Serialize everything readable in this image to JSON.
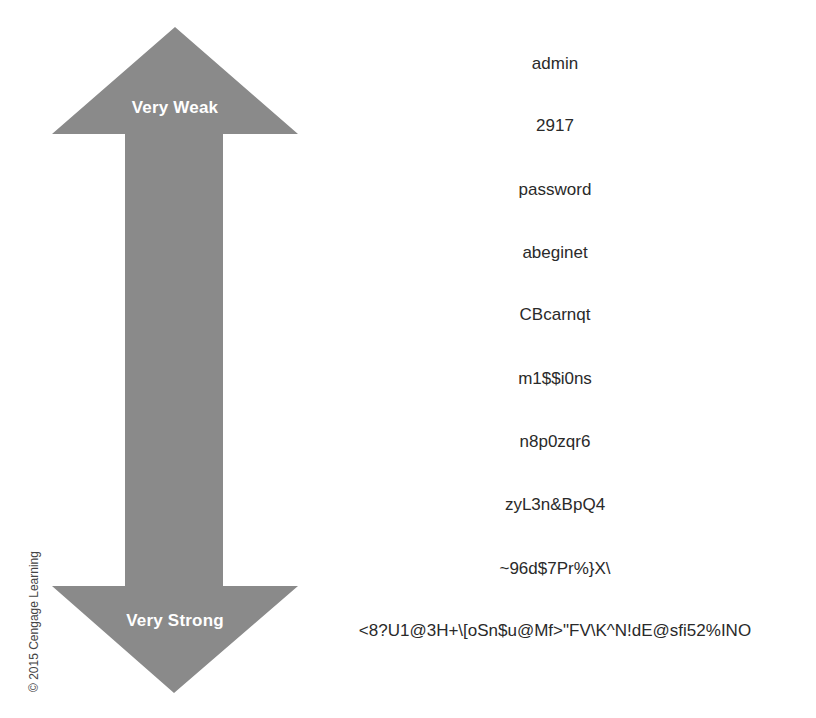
{
  "diagram": {
    "arrow": {
      "top_label": "Very Weak",
      "bottom_label": "Very Strong",
      "color": "#8a8a8a",
      "label_color": "#ffffff"
    },
    "passwords": [
      "admin",
      "2917",
      "password",
      "abeginet",
      "CBcarnqt",
      "m1$$i0ns",
      "n8p0zqr6",
      "zyL3n&BpQ4",
      "~96d$7Pr%}X\\",
      "<8?U1@3H+\\[oSn$u@Mf>\"FV\\K^N!dE@sfi52%INO"
    ],
    "copyright": "© 2015 Cengage Learning"
  }
}
